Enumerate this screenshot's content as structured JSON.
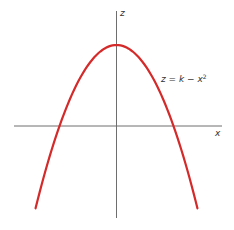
{
  "chart_data": {
    "type": "line",
    "title": "",
    "xlabel": "x",
    "ylabel": "z",
    "grid": false,
    "legend": null,
    "annotations": [
      {
        "text_base": "z = k − x",
        "text_sup": "2",
        "position": "right of curve, upper right"
      }
    ],
    "series": [
      {
        "name": "z = k − x²",
        "color": "#d42a2a",
        "equation": "z = k - x^2",
        "k": 1,
        "x": [
          -1.42,
          -1.2,
          -1.0,
          -0.8,
          -0.6,
          -0.4,
          -0.2,
          0.0,
          0.2,
          0.4,
          0.6,
          0.8,
          1.0,
          1.2,
          1.42
        ],
        "values": [
          -1.02,
          -0.44,
          0.0,
          0.36,
          0.64,
          0.84,
          0.96,
          1.0,
          0.96,
          0.84,
          0.64,
          0.36,
          0.0,
          -0.44,
          -1.02
        ]
      }
    ],
    "xlim": [
      -1.8,
      1.9
    ],
    "ylim": [
      -1.13,
      1.42
    ],
    "ticks": "none"
  },
  "labels": {
    "z_axis": "z",
    "x_axis": "x",
    "equation_base": "z = k − x",
    "equation_sup": "2"
  },
  "colors": {
    "curve": "#d42a2a",
    "axes": "#6e6e6e",
    "background": "#ffffff"
  }
}
